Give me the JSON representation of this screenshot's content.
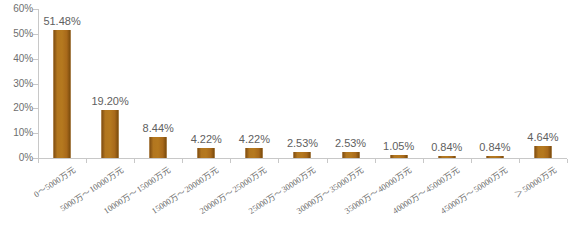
{
  "chart_data": {
    "type": "bar",
    "title": "",
    "subtitle": "",
    "xlabel": "",
    "ylabel": "",
    "ylim": [
      0,
      60
    ],
    "ytick_labels": [
      "0%",
      "10%",
      "20%",
      "30%",
      "40%",
      "50%",
      "60%"
    ],
    "ytick_values": [
      0,
      10,
      20,
      30,
      40,
      50,
      60
    ],
    "grid": false,
    "legend": false,
    "legend_position": "none",
    "bar_color": "#a2661b",
    "axis_color": "#c8c8c8",
    "label_color": "#6d6d6d",
    "value_label_color": "#606060",
    "background": "#ffffff",
    "value_suffix": "%",
    "categories": [
      "0～5000万元",
      "5000万～10000万元",
      "10000万～15000万元",
      "15000万～20000万元",
      "20000万～25000万元",
      "25000万～30000万元",
      "30000万～35000万元",
      "35000万～40000万元",
      "40000万～45000万元",
      "45000万～50000万元",
      "＞50000万元"
    ],
    "values": [
      51.48,
      19.2,
      8.44,
      4.22,
      4.22,
      2.53,
      2.53,
      1.05,
      0.84,
      0.84,
      4.64
    ],
    "value_labels": [
      "51.48%",
      "19.20%",
      "8.44%",
      "4.22%",
      "4.22%",
      "2.53%",
      "2.53%",
      "1.05%",
      "0.84%",
      "0.84%",
      "4.64%"
    ]
  }
}
